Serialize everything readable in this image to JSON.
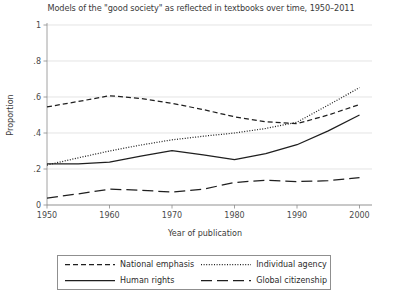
{
  "chart_data": {
    "type": "line",
    "title": "Models of the \"good society\" as reflected in textbooks over time, 1950–2011",
    "xlabel": "Year of publication",
    "ylabel": "Proportion",
    "xlim": [
      1950,
      2002
    ],
    "ylim": [
      0,
      1
    ],
    "grid": true,
    "legend_position": "bottom",
    "x_ticks": [
      "1950",
      "1960",
      "1970",
      "1980",
      "1990",
      "2000"
    ],
    "x_tick_values": [
      1950,
      1960,
      1970,
      1980,
      1990,
      2000
    ],
    "y_ticks": [
      "0",
      ".2",
      ".4",
      ".6",
      ".8",
      "1"
    ],
    "y_tick_values": [
      0,
      0.2,
      0.4,
      0.6,
      0.8,
      1
    ],
    "series": [
      {
        "name": "National emphasis",
        "style": "dashed",
        "dasharray": "5,3",
        "color": "#1f1f1f",
        "x": [
          1950,
          1955,
          1960,
          1965,
          1970,
          1975,
          1980,
          1985,
          1990,
          1995,
          2000
        ],
        "values": [
          0.545,
          0.575,
          0.607,
          0.592,
          0.565,
          0.53,
          0.49,
          0.462,
          0.452,
          0.5,
          0.558
        ]
      },
      {
        "name": "Individual agency",
        "style": "dotted",
        "dasharray": "1,1.6",
        "color": "#1f1f1f",
        "x": [
          1950,
          1955,
          1960,
          1965,
          1970,
          1975,
          1980,
          1985,
          1990,
          1995,
          2000
        ],
        "values": [
          0.222,
          0.262,
          0.3,
          0.333,
          0.362,
          0.382,
          0.4,
          0.425,
          0.46,
          0.555,
          0.652
        ]
      },
      {
        "name": "Human rights",
        "style": "solid",
        "dasharray": "",
        "color": "#1f1f1f",
        "x": [
          1950,
          1955,
          1960,
          1965,
          1970,
          1975,
          1980,
          1985,
          1990,
          1995,
          2000
        ],
        "values": [
          0.228,
          0.228,
          0.238,
          0.272,
          0.302,
          0.278,
          0.252,
          0.285,
          0.335,
          0.412,
          0.5
        ]
      },
      {
        "name": "Global citizenship",
        "style": "long-dashed",
        "dasharray": "11,5",
        "color": "#1f1f1f",
        "x": [
          1950,
          1955,
          1960,
          1965,
          1970,
          1975,
          1980,
          1985,
          1990,
          1995,
          2000
        ],
        "values": [
          0.038,
          0.062,
          0.088,
          0.082,
          0.072,
          0.088,
          0.125,
          0.138,
          0.13,
          0.135,
          0.152
        ]
      }
    ]
  },
  "legend": {
    "entries": [
      {
        "label": "National emphasis"
      },
      {
        "label": "Individual agency"
      },
      {
        "label": "Human rights"
      },
      {
        "label": "Global citizenship"
      }
    ]
  }
}
